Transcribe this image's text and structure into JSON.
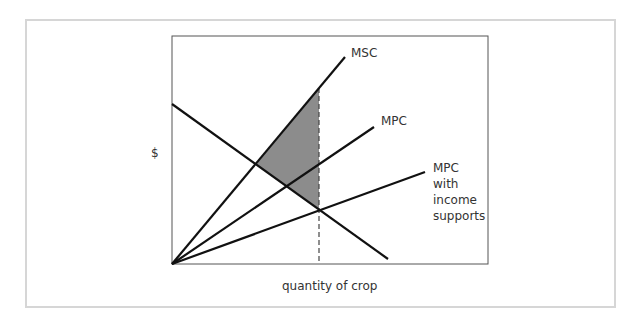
{
  "chart_data": {
    "type": "diagram",
    "title": "",
    "xlabel": "quantity of crop",
    "ylabel": "$",
    "grid": false,
    "curves": [
      {
        "name": "MSC",
        "label": "MSC",
        "kind": "supply",
        "from": [
          172,
          264
        ],
        "to": [
          345,
          57
        ]
      },
      {
        "name": "MPC",
        "label": "MPC",
        "kind": "supply",
        "from": [
          172,
          264
        ],
        "to": [
          374,
          127
        ]
      },
      {
        "name": "MPC with income supports",
        "label_lines": [
          "MPC",
          "with",
          "income",
          "supports"
        ],
        "kind": "supply",
        "from": [
          172,
          264
        ],
        "to": [
          425,
          172
        ]
      },
      {
        "name": "Demand",
        "label": "",
        "kind": "demand",
        "from": [
          172,
          104
        ],
        "to": [
          388,
          259
        ]
      }
    ],
    "dashed_vertical": {
      "x": 319,
      "y_top": 88,
      "y_bottom": 264
    },
    "shaded_region": {
      "description": "Deadweight loss triangle between MSC and demand up to the quantity with income supports",
      "vertices": [
        [
          256,
          164
        ],
        [
          319,
          88
        ],
        [
          319,
          209
        ]
      ],
      "color": "#8c8c8c"
    }
  },
  "labels": {
    "y_axis": "$",
    "x_axis": "quantity of crop",
    "msc": "MSC",
    "mpc": "MPC",
    "mpc_is": [
      "MPC",
      "with",
      "income",
      "supports"
    ]
  },
  "colors": {
    "line": "#111111",
    "shade": "#8c8c8c",
    "panel_border": "#d6d6d6",
    "axis": "#444444",
    "text": "#333333"
  }
}
